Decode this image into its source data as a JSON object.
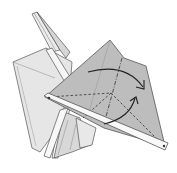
{
  "figure": {
    "type": "origami-step-diagram",
    "colors": {
      "background": "#ffffff",
      "paper_light": "#e4e4e4",
      "paper_mid": "#d2d2d2",
      "paper_gray": "#bdbdbd",
      "paper_white": "#f8f8f8",
      "outline": "#555555",
      "fold_line": "#333333",
      "arrow": "#222222"
    },
    "symbols": [
      {
        "name": "valley-fold-line",
        "count": 3
      },
      {
        "name": "mountain-fold-line",
        "count": 1
      },
      {
        "name": "curved-fold-arrow",
        "count": 2
      },
      {
        "name": "reference-point",
        "count": 2
      }
    ]
  }
}
